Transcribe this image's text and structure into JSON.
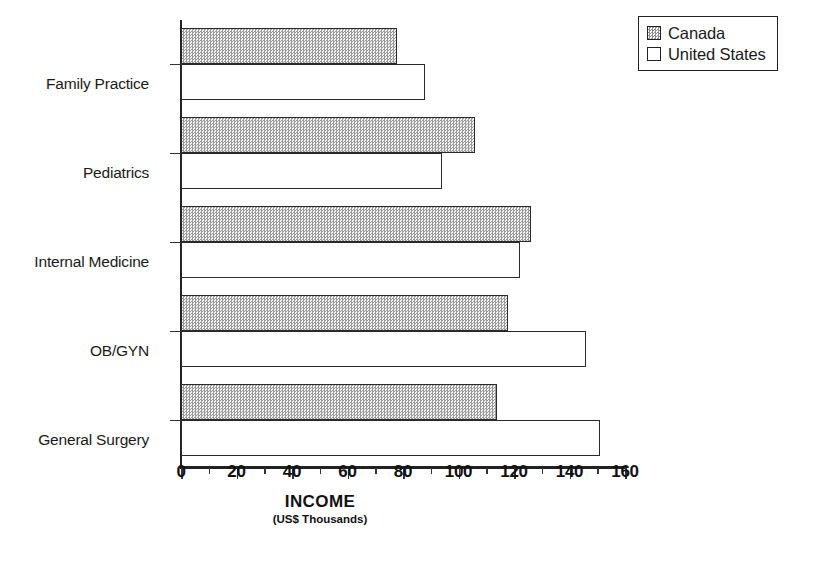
{
  "chart_data": {
    "type": "bar",
    "orientation": "horizontal",
    "title": "",
    "xlabel": "INCOME",
    "xlabel_sub": "(US$ Thousands)",
    "ylabel": "",
    "xlim": [
      0,
      160
    ],
    "xticks": [
      0,
      20,
      40,
      60,
      80,
      100,
      120,
      140,
      160
    ],
    "xticklabels": [
      "0",
      "20",
      "40",
      "60",
      "80",
      "100",
      "120",
      "140",
      "160"
    ],
    "minor_tick_step": 10,
    "grid": false,
    "legend_position": "top-right",
    "categories": [
      "Family Practice",
      "Pediatrics",
      "Internal Medicine",
      "OB/GYN",
      "General Surgery"
    ],
    "series": [
      {
        "name": "Canada",
        "fill": "dotted-hatch",
        "color": "#dcdcdc",
        "values": [
          78,
          106,
          126,
          118,
          114
        ]
      },
      {
        "name": "United States",
        "fill": "solid-white",
        "color": "#ffffff",
        "values": [
          88,
          94,
          122,
          146,
          151
        ]
      }
    ]
  },
  "legend": {
    "entries": [
      {
        "label": "Canada",
        "swatch": "canada-swatch"
      },
      {
        "label": "United States",
        "swatch": "united-states-swatch"
      }
    ]
  },
  "axis": {
    "x_title": "INCOME",
    "x_subtitle": "(US$ Thousands)"
  },
  "colors": {
    "axis": "#222222",
    "bar_outline": "#2a2a2a",
    "canada_fill": "#dcdcdc",
    "us_fill": "#ffffff",
    "background": "#ffffff"
  }
}
